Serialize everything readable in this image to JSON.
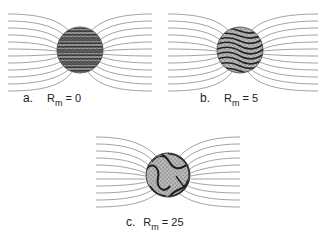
{
  "figure": {
    "panels": [
      {
        "id": "a",
        "letter": "a.",
        "symbol": "R",
        "subscript": "m",
        "equals": "= 0",
        "rm": 0,
        "center": [
          80,
          50
        ],
        "radius": 23
      },
      {
        "id": "b",
        "letter": "b.",
        "symbol": "R",
        "subscript": "m",
        "equals": "= 5",
        "rm": 5,
        "center": [
          240,
          50
        ],
        "radius": 23
      },
      {
        "id": "c",
        "letter": "c.",
        "symbol": "R",
        "subscript": "m",
        "equals": "= 25",
        "rm": 25,
        "center": [
          168,
          175
        ],
        "radius": 22
      }
    ],
    "colors": {
      "field_line": "#777777",
      "sphere_dark": "#3a3a3a",
      "sphere_light": "#bdbdbd",
      "text": "#222222"
    }
  }
}
